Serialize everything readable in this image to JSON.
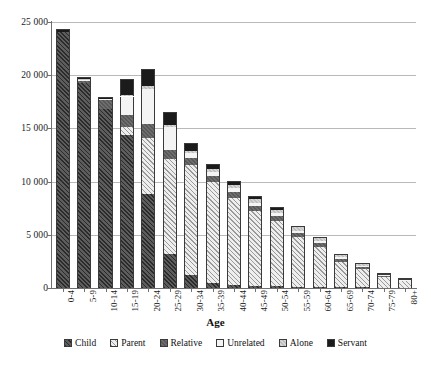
{
  "chart_data": {
    "type": "bar",
    "subtype": "stacked-bar",
    "title": "",
    "xlabel": "Age",
    "ylabel": "",
    "ylim": [
      0,
      25000
    ],
    "yticks": [
      0,
      5000,
      10000,
      15000,
      20000,
      25000
    ],
    "ytick_labels": [
      "0",
      "5 000",
      "10 000",
      "15 000",
      "20 000",
      "25 000"
    ],
    "grid": true,
    "grid_axis": "y",
    "legend_position": "bottom",
    "categories": [
      "0-4",
      "5-9",
      "10-14",
      "15-19",
      "20-24",
      "25-29",
      "30-34",
      "35-39",
      "40-44",
      "45-49",
      "50-54",
      "55-59",
      "60-64",
      "65-69",
      "70-74",
      "75-79",
      "80+"
    ],
    "series": [
      {
        "name": "Child",
        "pattern": "dark-diagonal-hatch",
        "color": "#4a4a4a",
        "values": [
          24050,
          19300,
          16850,
          14350,
          8800,
          3150,
          1200,
          500,
          300,
          200,
          150,
          110,
          90,
          70,
          55,
          40,
          30
        ]
      },
      {
        "name": "Parent",
        "pattern": "light-diagonal-hatch",
        "color": "#e3e3e3",
        "values": [
          0,
          0,
          0,
          750,
          5300,
          8950,
          10400,
          9450,
          8200,
          7050,
          6150,
          4650,
          3800,
          2400,
          1750,
          1000,
          600
        ]
      },
      {
        "name": "Relative",
        "pattern": "medium-gray-solid",
        "color": "#656565",
        "values": [
          0,
          180,
          800,
          1200,
          1350,
          900,
          600,
          550,
          520,
          480,
          450,
          400,
          330,
          260,
          200,
          130,
          80
        ]
      },
      {
        "name": "Unrelated",
        "pattern": "very-light-solid",
        "color": "#f4f4f4",
        "values": [
          0,
          120,
          110,
          1700,
          3300,
          2100,
          460,
          380,
          350,
          300,
          280,
          230,
          190,
          140,
          100,
          60,
          40
        ]
      },
      {
        "name": "Alone",
        "pattern": "light-gray-hatch",
        "color": "#c9c9c9",
        "values": [
          0,
          60,
          50,
          150,
          250,
          230,
          240,
          260,
          290,
          320,
          340,
          300,
          260,
          200,
          150,
          90,
          60
        ]
      },
      {
        "name": "Servant",
        "pattern": "black-solid",
        "color": "#1b1b1b",
        "values": [
          250,
          160,
          170,
          1450,
          1600,
          1200,
          700,
          500,
          360,
          270,
          200,
          150,
          110,
          80,
          55,
          35,
          25
        ]
      }
    ],
    "totals": [
      24300,
      19820,
      17980,
      19600,
      20600,
      16530,
      13600,
      11640,
      10020,
      8620,
      7570,
      5840,
      4780,
      3150,
      2310,
      1355,
      835
    ]
  },
  "legend": {
    "items": [
      {
        "label": "Child",
        "key": "child"
      },
      {
        "label": "Parent",
        "key": "parent"
      },
      {
        "label": "Relative",
        "key": "relative"
      },
      {
        "label": "Unrelated",
        "key": "unrelated"
      },
      {
        "label": "Alone",
        "key": "alone"
      },
      {
        "label": "Servant",
        "key": "servant"
      }
    ]
  }
}
